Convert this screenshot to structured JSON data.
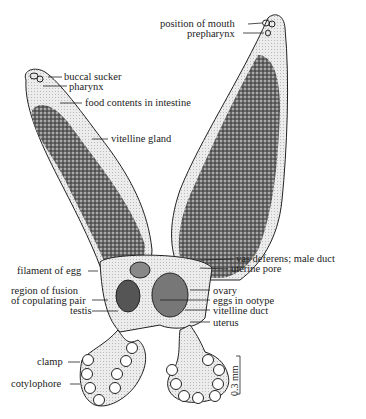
{
  "figure": {
    "labels_right_upper": {
      "position_of_mouth": "position of mouth",
      "prepharynx": "prepharynx"
    },
    "labels_left_arm": {
      "buccal_sucker": "buccal sucker",
      "pharynx": "pharynx",
      "food_contents": "food contents in intestine",
      "vitelline_gland": "vitelline gland"
    },
    "labels_center_right": {
      "vas_deferens": "vas deferens; male duct",
      "uterine_pore": "uterine pore",
      "ovary": "ovary",
      "eggs_in_ootype": "eggs in ootype",
      "vitelline_duct": "vitelline duct",
      "uterus": "uterus"
    },
    "labels_center_left": {
      "filament_of_egg": "filament of egg",
      "region_of_fusion_1": "region of fusion",
      "region_of_fusion_2": "of copulating pair",
      "testis": "testis"
    },
    "labels_bottom_left": {
      "clamp": "clamp",
      "cotylophore": "cotylophore"
    },
    "scale_bar": {
      "label": "0.3 mm"
    },
    "colors": {
      "ink": "#222222",
      "body_fill": "#e4e4e4",
      "gland_fill": "#6a6a6a"
    }
  }
}
